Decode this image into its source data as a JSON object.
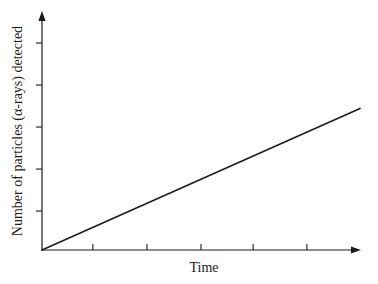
{
  "figure": {
    "background": "#ffffff",
    "axis_color": "#1c1c1c",
    "line_color": "#1c1c1c",
    "text_color": "#1c1c1c"
  },
  "chart_data": {
    "type": "line",
    "title": "",
    "xlabel": "Time",
    "ylabel": "Number of particles (α-rays) detected",
    "series": [
      {
        "name": "particles-detected-vs-time",
        "x": [
          0,
          1.0
        ],
        "y": [
          0,
          0.6
        ]
      }
    ],
    "xlim": [
      0,
      1
    ],
    "ylim": [
      0,
      1
    ],
    "grid": false,
    "legend": false,
    "axis_tick_labels": "none",
    "x_tick_fractions": [
      0.16,
      0.33,
      0.5,
      0.664,
      0.833
    ],
    "y_tick_fractions": [
      0.165,
      0.343,
      0.521,
      0.699,
      0.877
    ],
    "line_style": "solid",
    "shape_note": "straight line through origin with constant positive slope"
  }
}
